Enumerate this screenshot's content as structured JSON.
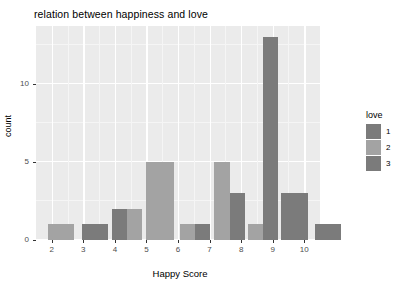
{
  "chart_data": {
    "type": "bar",
    "title": "relation between happiness and love",
    "xlabel": "Happy Score",
    "ylabel": "count",
    "categories": [
      "2",
      "3",
      "4",
      "5",
      "6",
      "7",
      "8",
      "9",
      "10"
    ],
    "xlim": [
      1.5,
      10.5
    ],
    "ylim": [
      0,
      13.7
    ],
    "x_ticks": [
      "2",
      "3",
      "4",
      "5",
      "6",
      "7",
      "8",
      "9",
      "10"
    ],
    "y_ticks": [
      "0",
      "5",
      "10"
    ],
    "y_tick_values": [
      0,
      5,
      10
    ],
    "grid": true,
    "legend_position": "right",
    "legend_title": "love",
    "series": [
      {
        "name": "1",
        "color": "#7b7b7b",
        "points": [
          {
            "x": "3",
            "value": 1
          },
          {
            "x": "4",
            "value": 2
          },
          {
            "x": "6",
            "value": 1
          },
          {
            "x": "7",
            "value": 3
          },
          {
            "x": "8",
            "value": 13
          },
          {
            "x": "9",
            "value": 3
          },
          {
            "x": "10",
            "value": 1
          }
        ]
      },
      {
        "name": "2",
        "color": "#a3a3a3",
        "points": [
          {
            "x": "2",
            "value": 1
          },
          {
            "x": "4",
            "value": 2
          },
          {
            "x": "5",
            "value": 5
          },
          {
            "x": "6",
            "value": 1
          },
          {
            "x": "7",
            "value": 5
          },
          {
            "x": "8",
            "value": 1
          }
        ]
      },
      {
        "name": "3",
        "color": "#7b7b7b",
        "points": []
      }
    ],
    "bars": [
      {
        "label": "2-love2",
        "x": "2",
        "group": "2",
        "value": 1,
        "color": "#a3a3a3",
        "left_px": 12,
        "width_px": 26
      },
      {
        "label": "3-love1",
        "x": "3",
        "group": "1",
        "value": 1,
        "color": "#7b7b7b",
        "left_px": 46,
        "width_px": 26
      },
      {
        "label": "4-love1",
        "x": "4",
        "group": "1",
        "value": 2,
        "color": "#7b7b7b",
        "left_px": 76,
        "width_px": 15
      },
      {
        "label": "4-love2",
        "x": "4",
        "group": "2",
        "value": 2,
        "color": "#a3a3a3",
        "left_px": 91,
        "width_px": 15
      },
      {
        "label": "5-love2",
        "x": "5",
        "group": "2",
        "value": 5,
        "color": "#a3a3a3",
        "left_px": 110,
        "width_px": 28
      },
      {
        "label": "6-love2",
        "x": "6",
        "group": "2",
        "value": 1,
        "color": "#a3a3a3",
        "left_px": 144,
        "width_px": 15
      },
      {
        "label": "6-love1",
        "x": "6",
        "group": "1",
        "value": 1,
        "color": "#7b7b7b",
        "left_px": 159,
        "width_px": 15
      },
      {
        "label": "7-love2",
        "x": "7",
        "group": "2",
        "value": 5,
        "color": "#a3a3a3",
        "left_px": 178,
        "width_px": 16
      },
      {
        "label": "7-love1",
        "x": "7",
        "group": "1",
        "value": 3,
        "color": "#7b7b7b",
        "left_px": 194,
        "width_px": 15
      },
      {
        "label": "8-love2",
        "x": "8",
        "group": "2",
        "value": 1,
        "color": "#a3a3a3",
        "left_px": 212,
        "width_px": 15
      },
      {
        "label": "8-love1",
        "x": "8",
        "group": "1",
        "value": 13,
        "color": "#7b7b7b",
        "left_px": 227,
        "width_px": 15
      },
      {
        "label": "9-love1",
        "x": "9",
        "group": "1",
        "value": 3,
        "color": "#7b7b7b",
        "left_px": 245,
        "width_px": 27
      },
      {
        "label": "10-love1",
        "x": "10",
        "group": "1",
        "value": 1,
        "color": "#7b7b7b",
        "left_px": 279,
        "width_px": 26
      }
    ]
  },
  "legend": {
    "title": "love",
    "items": [
      {
        "label": "1",
        "color": "#7b7b7b"
      },
      {
        "label": "2",
        "color": "#a3a3a3"
      },
      {
        "label": "3",
        "color": "#7b7b7b"
      }
    ]
  },
  "panel": {
    "background": "#ebebeb",
    "gridline_color": "#ffffff"
  }
}
